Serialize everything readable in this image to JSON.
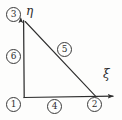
{
  "figure": {
    "kind": "triangular-finite-element-diagram",
    "background_color": "#fdfdfc",
    "ink_color": "#2e2e2e"
  },
  "axes": {
    "horizontal": {
      "symbol": "ξ",
      "name": "xi",
      "arrow": true
    },
    "vertical": {
      "symbol": "η",
      "name": "eta",
      "arrow": true
    }
  },
  "nodes": [
    {
      "id": "1",
      "label": "①",
      "text": "1",
      "position": "bottom-left"
    },
    {
      "id": "2",
      "label": "②",
      "text": "2",
      "position": "bottom-right"
    },
    {
      "id": "3",
      "label": "③",
      "text": "3",
      "position": "top-left"
    }
  ],
  "edges": [
    {
      "id": "4",
      "label": "④",
      "text": "4",
      "between": "1-2",
      "position": "bottom"
    },
    {
      "id": "5",
      "label": "⑤",
      "text": "5",
      "between": "2-3",
      "position": "hypotenuse"
    },
    {
      "id": "6",
      "label": "⑥",
      "text": "6",
      "between": "3-1",
      "position": "left"
    }
  ],
  "geometry": {
    "apex": "3",
    "origin": "1",
    "right_vertex": "2"
  }
}
